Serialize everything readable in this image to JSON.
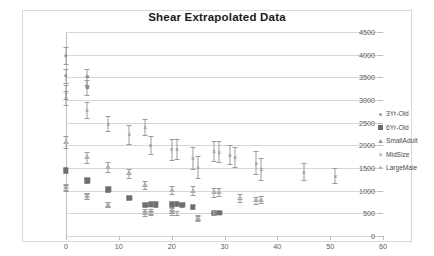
{
  "chart_data": {
    "type": "scatter",
    "title": "Shear Extrapolated Data",
    "xlabel": "",
    "ylabel": "",
    "xlim": [
      0,
      60
    ],
    "ylim": [
      0,
      4500
    ],
    "xticks": [
      0,
      10,
      20,
      30,
      40,
      50,
      60
    ],
    "yticks": [
      0,
      500,
      1000,
      1500,
      2000,
      2500,
      3000,
      3500,
      4000,
      4500
    ],
    "grid": true,
    "error_bars": true,
    "legend_position": "right",
    "series": [
      {
        "name": "3Yr-Old",
        "marker": "dot",
        "color": "#8f8f8f",
        "points": [
          {
            "x": 0,
            "y": 3980,
            "err": 180
          },
          {
            "x": 0,
            "y": 3530,
            "err": 150
          },
          {
            "x": 4,
            "y": 3510,
            "err": 180
          },
          {
            "x": 4,
            "y": 3280,
            "err": 160
          }
        ]
      },
      {
        "name": "6Yr-Old",
        "marker": "square",
        "color": "#6e6e6e",
        "points": [
          {
            "x": 0,
            "y": 1450,
            "err": 60
          },
          {
            "x": 4,
            "y": 1230,
            "err": 55
          },
          {
            "x": 8,
            "y": 1030,
            "err": 50
          },
          {
            "x": 12,
            "y": 840,
            "err": 45
          },
          {
            "x": 15,
            "y": 690,
            "err": 45
          },
          {
            "x": 16,
            "y": 700,
            "err": 45
          },
          {
            "x": 17,
            "y": 695,
            "err": 45
          },
          {
            "x": 20,
            "y": 700,
            "err": 50
          },
          {
            "x": 21,
            "y": 705,
            "err": 45
          },
          {
            "x": 22,
            "y": 690,
            "err": 40
          },
          {
            "x": 24,
            "y": 640,
            "err": 45
          },
          {
            "x": 28,
            "y": 510,
            "err": 40
          },
          {
            "x": 29,
            "y": 515,
            "err": 40
          }
        ]
      },
      {
        "name": "SmallAdult",
        "marker": "triangle",
        "color": "#b0b0b0",
        "points": [
          {
            "x": 0,
            "y": 2080,
            "err": 130
          },
          {
            "x": 0,
            "y": 1080,
            "err": 70
          },
          {
            "x": 4,
            "y": 1740,
            "err": 120
          },
          {
            "x": 4,
            "y": 880,
            "err": 60
          },
          {
            "x": 8,
            "y": 1530,
            "err": 110
          },
          {
            "x": 8,
            "y": 690,
            "err": 55
          },
          {
            "x": 12,
            "y": 1380,
            "err": 100
          },
          {
            "x": 15,
            "y": 1120,
            "err": 90
          },
          {
            "x": 15,
            "y": 540,
            "err": 55
          },
          {
            "x": 16,
            "y": 545,
            "err": 50
          },
          {
            "x": 20,
            "y": 1020,
            "err": 90
          },
          {
            "x": 20,
            "y": 560,
            "err": 55
          },
          {
            "x": 24,
            "y": 1000,
            "err": 95
          },
          {
            "x": 25,
            "y": 400,
            "err": 55
          },
          {
            "x": 28,
            "y": 960,
            "err": 90
          },
          {
            "x": 29,
            "y": 965,
            "err": 90
          },
          {
            "x": 33,
            "y": 840,
            "err": 80
          },
          {
            "x": 36,
            "y": 790,
            "err": 75
          },
          {
            "x": 37,
            "y": 800,
            "err": 75
          }
        ]
      },
      {
        "name": "MidSize",
        "marker": "x",
        "color": "#8a8a8a",
        "points": [
          {
            "x": 0,
            "y": 3180,
            "err": 160
          },
          {
            "x": 0,
            "y": 3040,
            "err": 150
          },
          {
            "x": 4,
            "y": 2780,
            "err": 180
          },
          {
            "x": 8,
            "y": 2480,
            "err": 170
          },
          {
            "x": 12,
            "y": 2240,
            "err": 200
          },
          {
            "x": 15,
            "y": 2400,
            "err": 170
          },
          {
            "x": 16,
            "y": 2010,
            "err": 200
          },
          {
            "x": 20,
            "y": 1910,
            "err": 240
          },
          {
            "x": 21,
            "y": 1920,
            "err": 230
          },
          {
            "x": 24,
            "y": 1720,
            "err": 250
          },
          {
            "x": 25,
            "y": 1520,
            "err": 240
          },
          {
            "x": 28,
            "y": 1880,
            "err": 220
          },
          {
            "x": 29,
            "y": 1860,
            "err": 230
          },
          {
            "x": 31,
            "y": 1790,
            "err": 210
          },
          {
            "x": 32,
            "y": 1740,
            "err": 220
          },
          {
            "x": 36,
            "y": 1620,
            "err": 260
          },
          {
            "x": 37,
            "y": 1480,
            "err": 250
          },
          {
            "x": 45,
            "y": 1420,
            "err": 190
          },
          {
            "x": 51,
            "y": 1330,
            "err": 160
          }
        ]
      },
      {
        "name": "LargeMale",
        "marker": "plus",
        "color": "#b4b4b4",
        "points": [
          {
            "x": 0,
            "y": 1060,
            "err": 60
          },
          {
            "x": 4,
            "y": 870,
            "err": 55
          },
          {
            "x": 8,
            "y": 700,
            "err": 50
          },
          {
            "x": 15,
            "y": 500,
            "err": 50
          },
          {
            "x": 16,
            "y": 505,
            "err": 50
          },
          {
            "x": 20,
            "y": 520,
            "err": 50
          },
          {
            "x": 21,
            "y": 510,
            "err": 45
          },
          {
            "x": 25,
            "y": 390,
            "err": 50
          },
          {
            "x": 28,
            "y": 500,
            "err": 45
          }
        ]
      }
    ]
  },
  "legend": {
    "items": [
      {
        "label": "3Yr-Old",
        "marker": "dot"
      },
      {
        "label": "6Yr-Old",
        "marker": "square"
      },
      {
        "label": "SmallAdult",
        "marker": "triangle"
      },
      {
        "label": "MidSize",
        "marker": "x"
      },
      {
        "label": "LargeMale",
        "marker": "plus"
      }
    ]
  }
}
